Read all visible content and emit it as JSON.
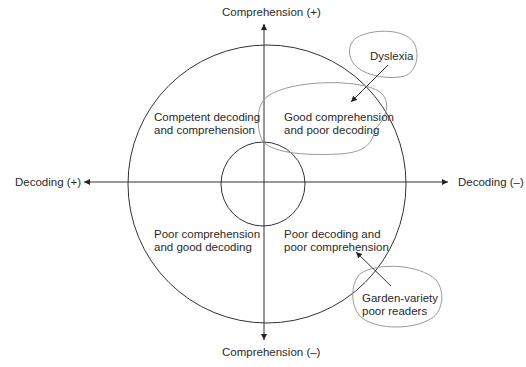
{
  "axes": {
    "comprehension_plus": "Comprehension (+)",
    "comprehension_minus": "Comprehension (–)",
    "decoding_plus": "Decoding (+)",
    "decoding_minus": "Decoding (–)"
  },
  "quadrants": {
    "top_left": [
      "Competent decoding",
      "and comprehension"
    ],
    "top_right": [
      "Good comprehension",
      "and poor decoding"
    ],
    "bottom_left": [
      "Poor comprehension",
      "and good decoding"
    ],
    "bottom_right": [
      "Poor decoding and",
      "poor comprehension"
    ]
  },
  "callouts": {
    "dyslexia": "Dyslexia",
    "garden_variety": [
      "Garden-variety",
      "poor readers"
    ]
  },
  "colors": {
    "line": "#333333",
    "callout_outline": "#9a9a9a"
  }
}
